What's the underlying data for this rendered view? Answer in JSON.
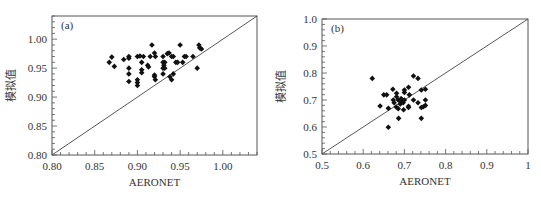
{
  "chart_data": [
    {
      "type": "scatter",
      "panel_label": "(a)",
      "xlabel": "AERONET",
      "ylabel": "模拟值",
      "xlim": [
        0.8,
        1.04
      ],
      "ylim": [
        0.8,
        1.04
      ],
      "xticks": [
        0.8,
        0.85,
        0.9,
        0.95,
        1.0
      ],
      "xtick_labels": [
        "0.80",
        "0.85",
        "0.90",
        "0.95",
        "1.00"
      ],
      "yticks": [
        0.8,
        0.85,
        0.9,
        0.95,
        1.0
      ],
      "ytick_labels": [
        "0.80",
        "0.85",
        "0.90",
        "0.95",
        "1.00"
      ],
      "minor_ticks_per_major": 5,
      "grid": false,
      "reference_line": "1:1",
      "marker": "diamond",
      "color": "#111111",
      "points": [
        [
          0.867,
          0.96
        ],
        [
          0.87,
          0.969
        ],
        [
          0.873,
          0.953
        ],
        [
          0.884,
          0.965
        ],
        [
          0.89,
          0.97
        ],
        [
          0.89,
          0.967
        ],
        [
          0.89,
          0.95
        ],
        [
          0.89,
          0.94
        ],
        [
          0.89,
          0.927
        ],
        [
          0.9,
          0.97
        ],
        [
          0.903,
          0.971
        ],
        [
          0.907,
          0.97
        ],
        [
          0.9,
          0.93
        ],
        [
          0.9,
          0.925
        ],
        [
          0.9,
          0.92
        ],
        [
          0.905,
          0.96
        ],
        [
          0.905,
          0.947
        ],
        [
          0.905,
          0.942
        ],
        [
          0.912,
          0.955
        ],
        [
          0.913,
          0.952
        ],
        [
          0.917,
          0.99
        ],
        [
          0.915,
          0.97
        ],
        [
          0.92,
          0.976
        ],
        [
          0.921,
          0.97
        ],
        [
          0.92,
          0.938
        ],
        [
          0.92,
          0.935
        ],
        [
          0.921,
          0.93
        ],
        [
          0.93,
          0.97
        ],
        [
          0.93,
          0.96
        ],
        [
          0.931,
          0.955
        ],
        [
          0.932,
          0.96
        ],
        [
          0.93,
          0.95
        ],
        [
          0.932,
          0.95
        ],
        [
          0.93,
          0.94
        ],
        [
          0.935,
          0.975
        ],
        [
          0.937,
          0.976
        ],
        [
          0.94,
          0.97
        ],
        [
          0.942,
          0.97
        ],
        [
          0.938,
          0.935
        ],
        [
          0.94,
          0.93
        ],
        [
          0.942,
          0.94
        ],
        [
          0.945,
          0.96
        ],
        [
          0.947,
          0.96
        ],
        [
          0.95,
          0.99
        ],
        [
          0.955,
          0.97
        ],
        [
          0.957,
          0.97
        ],
        [
          0.953,
          0.96
        ],
        [
          0.965,
          0.97
        ],
        [
          0.97,
          0.95
        ],
        [
          0.972,
          0.99
        ],
        [
          0.973,
          0.985
        ],
        [
          0.975,
          0.983
        ]
      ]
    },
    {
      "type": "scatter",
      "panel_label": "(b)",
      "xlabel": "AERONET",
      "ylabel": "模拟值",
      "xlim": [
        0.5,
        1.0
      ],
      "ylim": [
        0.5,
        1.0
      ],
      "xticks": [
        0.5,
        0.6,
        0.7,
        0.8,
        0.9,
        1.0
      ],
      "xtick_labels": [
        "0.5",
        "0.6",
        "0.7",
        "0.8",
        "0.9",
        "1"
      ],
      "yticks": [
        0.5,
        0.6,
        0.7,
        0.8,
        0.9,
        1.0
      ],
      "ytick_labels": [
        "0.5",
        "0.6",
        "0.7",
        "0.8",
        "0.9",
        "1.0"
      ],
      "minor_ticks_per_major": 5,
      "grid": false,
      "reference_line": "1:1",
      "marker": "diamond",
      "color": "#111111",
      "points": [
        [
          0.622,
          0.78
        ],
        [
          0.641,
          0.678
        ],
        [
          0.65,
          0.719
        ],
        [
          0.657,
          0.719
        ],
        [
          0.661,
          0.669
        ],
        [
          0.661,
          0.599
        ],
        [
          0.672,
          0.74
        ],
        [
          0.673,
          0.7
        ],
        [
          0.675,
          0.69
        ],
        [
          0.681,
          0.725
        ],
        [
          0.681,
          0.712
        ],
        [
          0.68,
          0.674
        ],
        [
          0.685,
          0.668
        ],
        [
          0.685,
          0.7
        ],
        [
          0.69,
          0.695
        ],
        [
          0.686,
          0.632
        ],
        [
          0.692,
          0.705
        ],
        [
          0.695,
          0.7
        ],
        [
          0.697,
          0.69
        ],
        [
          0.69,
          0.685
        ],
        [
          0.698,
          0.664
        ],
        [
          0.7,
          0.737
        ],
        [
          0.7,
          0.728
        ],
        [
          0.7,
          0.7
        ],
        [
          0.71,
          0.747
        ],
        [
          0.71,
          0.677
        ],
        [
          0.71,
          0.672
        ],
        [
          0.712,
          0.719
        ],
        [
          0.722,
          0.789
        ],
        [
          0.722,
          0.7
        ],
        [
          0.733,
          0.78
        ],
        [
          0.733,
          0.69
        ],
        [
          0.741,
          0.737
        ],
        [
          0.741,
          0.672
        ],
        [
          0.741,
          0.632
        ],
        [
          0.746,
          0.675
        ],
        [
          0.751,
          0.74
        ],
        [
          0.751,
          0.7
        ],
        [
          0.751,
          0.68
        ]
      ]
    }
  ]
}
